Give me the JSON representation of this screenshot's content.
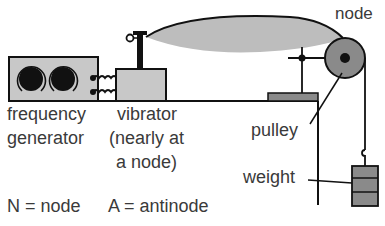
{
  "diagram": {
    "type": "standing-wave-apparatus",
    "labels": {
      "node_top": "node",
      "frequency_generator_line1": "frequency",
      "frequency_generator_line2": "generator",
      "vibrator_line1": "vibrator",
      "vibrator_line2": "(nearly at",
      "vibrator_line3": "a node)",
      "pulley": "pulley",
      "weight": "weight",
      "legend_node": "N = node",
      "legend_antinode": "A = antinode"
    },
    "components": [
      {
        "name": "frequency-generator",
        "knobs": 2
      },
      {
        "name": "connecting-wires",
        "count": 2
      },
      {
        "name": "vibrator"
      },
      {
        "name": "string-standing-wave",
        "loops": 1
      },
      {
        "name": "clamp"
      },
      {
        "name": "pulley"
      },
      {
        "name": "bench"
      },
      {
        "name": "hanging-weight",
        "slots": 3
      }
    ],
    "colors": {
      "fill_light": "#c8c8c8",
      "fill_dark": "#8a8a8a",
      "stroke": "#111111",
      "wave_fill": "#bdbdbd",
      "text": "#3a3a3a"
    }
  }
}
